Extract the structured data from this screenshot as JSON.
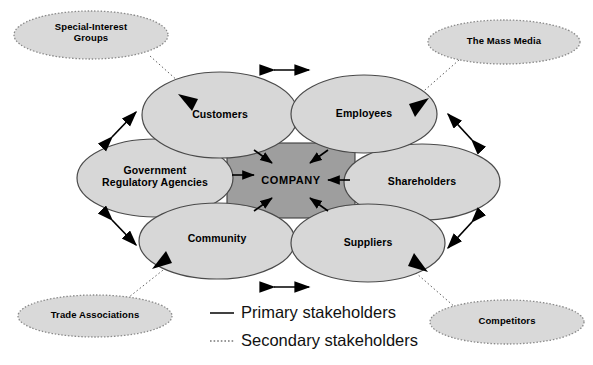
{
  "diagram": {
    "colors": {
      "ellipse_fill": "#d7d7d7",
      "ellipse_stroke": "#4a4a4a",
      "company_fill": "#9e9e9e",
      "company_stroke": "#3a3a3a",
      "arrow": "#000000",
      "text": "#000000",
      "background": "#ffffff"
    },
    "center": {
      "label": "COMPANY",
      "shape": "rectangle",
      "x": 227,
      "y": 143,
      "w": 128,
      "h": 75
    },
    "primary_stakeholders": [
      {
        "label": "Customers",
        "cx": 220,
        "cy": 115,
        "rx": 78,
        "ry": 43
      },
      {
        "label": "Employees",
        "cx": 364,
        "cy": 114,
        "rx": 73,
        "ry": 39
      },
      {
        "label": "Government\nRegulatory Agencies",
        "cx": 155,
        "cy": 178,
        "rx": 78,
        "ry": 39
      },
      {
        "label": "Shareholders",
        "cx": 422,
        "cy": 182,
        "rx": 78,
        "ry": 38
      },
      {
        "label": "Community",
        "cx": 217,
        "cy": 241,
        "rx": 78,
        "ry": 38
      },
      {
        "label": "Suppliers",
        "cx": 368,
        "cy": 243,
        "rx": 77,
        "ry": 39
      }
    ],
    "secondary_stakeholders": [
      {
        "label": "Special-Interest\nGroups",
        "cx": 91,
        "cy": 35,
        "rx": 77,
        "ry": 24
      },
      {
        "label": "The Mass Media",
        "cx": 504,
        "cy": 42,
        "rx": 76,
        "ry": 22
      },
      {
        "label": "Trade Associations",
        "cx": 95,
        "cy": 316,
        "rx": 77,
        "ry": 21
      },
      {
        "label": "Competitors",
        "cx": 507,
        "cy": 322,
        "rx": 77,
        "ry": 22
      }
    ],
    "legend": [
      {
        "label": "Primary stakeholders",
        "style": "solid"
      },
      {
        "label": "Secondary stakeholders",
        "style": "dotted"
      }
    ]
  }
}
